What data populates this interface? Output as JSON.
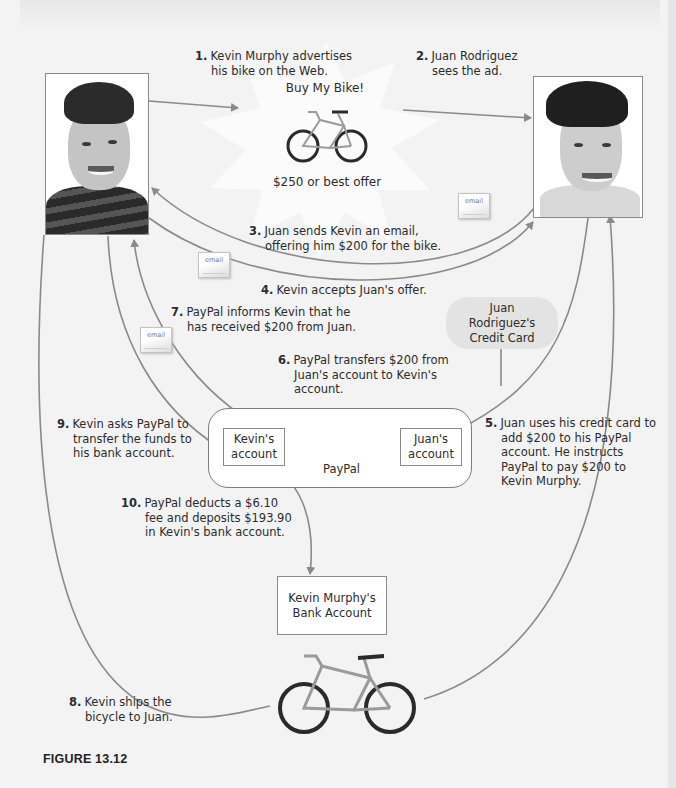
{
  "figure": {
    "caption": "FIGURE 13.12"
  },
  "people": {
    "kevin": {
      "name": "Kevin Murphy",
      "photo_icon": "kevin-portrait"
    },
    "juan": {
      "name": "Juan Rodriguez",
      "photo_icon": "juan-portrait"
    }
  },
  "ad": {
    "title": "Buy My Bike!",
    "price": "$250 or best offer",
    "image_icon": "bicycle"
  },
  "email_icon_label": "email",
  "nodes": {
    "credit_card": "Juan Rodriguez's Credit Card",
    "paypal": {
      "label": "PayPal",
      "kevin_account": "Kevin's account",
      "juan_account": "Juan's account"
    },
    "bank_account": "Kevin Murphy's Bank Account"
  },
  "steps": [
    {
      "num": "1.",
      "text": "Kevin Murphy advertises his bike on the Web."
    },
    {
      "num": "2.",
      "text": "Juan Rodriguez sees the ad."
    },
    {
      "num": "3.",
      "text": "Juan sends Kevin an email, offering him $200 for the bike."
    },
    {
      "num": "4.",
      "text": "Kevin accepts Juan's offer."
    },
    {
      "num": "5.",
      "text": "Juan uses his credit card to add $200 to his PayPal account. He instructs PayPal to pay $200 to Kevin Murphy."
    },
    {
      "num": "6.",
      "text": "PayPal transfers $200 from Juan's account to Kevin's account."
    },
    {
      "num": "7.",
      "text": "PayPal informs Kevin that he has received $200 from Juan."
    },
    {
      "num": "8.",
      "text": "Kevin ships the bicycle to Juan."
    },
    {
      "num": "9.",
      "text": "Kevin asks PayPal to transfer the funds to his bank account."
    },
    {
      "num": "10.",
      "text": "PayPal deducts a $6.10 fee and deposits $193.90 in Kevin's bank account."
    }
  ],
  "colors": {
    "arrow": "#8a8a8a",
    "background": "#f3f3f3",
    "credit_card_fill": "#e3e3e3"
  }
}
